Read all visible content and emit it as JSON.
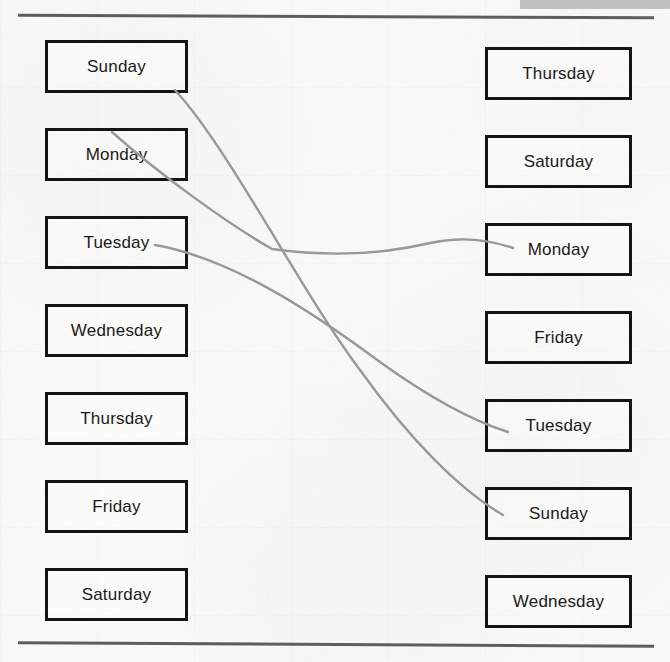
{
  "worksheet": {
    "type": "matching-exercise",
    "topic": "Days of the Week",
    "left_column": {
      "name": "ordered-days-column",
      "items": [
        {
          "label": "Sunday",
          "index": 0
        },
        {
          "label": "Monday",
          "index": 1
        },
        {
          "label": "Tuesday",
          "index": 2
        },
        {
          "label": "Wednesday",
          "index": 3
        },
        {
          "label": "Thursday",
          "index": 4
        },
        {
          "label": "Friday",
          "index": 5
        },
        {
          "label": "Saturday",
          "index": 6
        }
      ]
    },
    "right_column": {
      "name": "shuffled-days-column",
      "items": [
        {
          "label": "Thursday",
          "index": 0
        },
        {
          "label": "Saturday",
          "index": 1
        },
        {
          "label": "Monday",
          "index": 2
        },
        {
          "label": "Friday",
          "index": 3
        },
        {
          "label": "Tuesday",
          "index": 4
        },
        {
          "label": "Sunday",
          "index": 5
        },
        {
          "label": "Wednesday",
          "index": 6
        }
      ]
    },
    "connections": [
      {
        "name": "connector-sunday",
        "from": "Sunday",
        "to": "Sunday",
        "from_index": 0,
        "to_index": 5,
        "path": "M 175 90 C 230 150, 300 290, 360 370 C 410 440, 460 490, 503 515"
      },
      {
        "name": "connector-monday",
        "from": "Monday",
        "to": "Monday",
        "from_index": 1,
        "to_index": 2,
        "path": "M 112 132 C 160 175, 230 225, 272 249 C 330 257, 380 255, 430 243 C 462 236, 490 240, 513 248"
      },
      {
        "name": "connector-tuesday",
        "from": "Tuesday",
        "to": "Tuesday",
        "from_index": 2,
        "to_index": 4,
        "path": "M 155 245 C 230 258, 310 310, 380 362 C 430 398, 470 420, 508 432"
      }
    ],
    "colors": {
      "box_border": "#141414",
      "text": "#191919",
      "connector_line": "#98989a",
      "page_rule": "#5d5d5d",
      "redaction_bar": "#b9b9b9",
      "paper_background": "#fafaf8"
    }
  }
}
